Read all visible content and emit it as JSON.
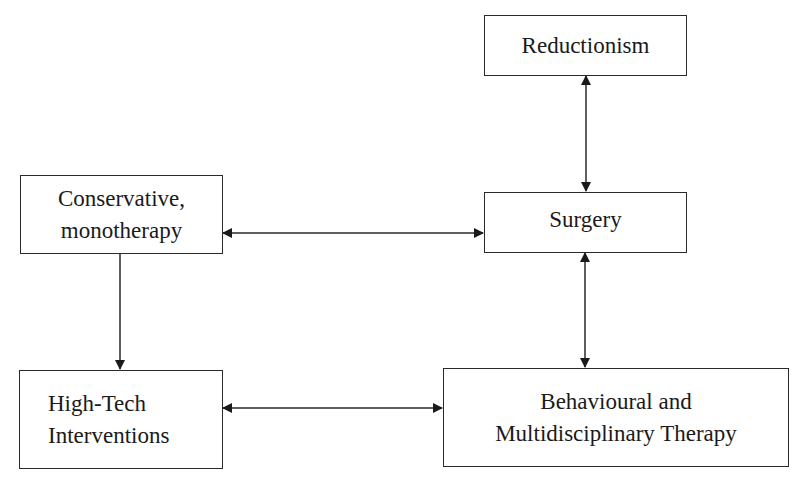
{
  "diagram": {
    "nodes": {
      "reductionism": {
        "lines": [
          "Reductionism"
        ]
      },
      "surgery": {
        "lines": [
          "Surgery"
        ]
      },
      "conservative": {
        "lines": [
          "Conservative,",
          "monotherapy"
        ]
      },
      "hightech": {
        "lines": [
          "High-Tech",
          "Interventions"
        ]
      },
      "behavioural": {
        "lines": [
          "Behavioural and",
          "Multidisciplinary Therapy"
        ]
      }
    },
    "edges": [
      {
        "from": "reductionism",
        "to": "surgery",
        "direction": "both"
      },
      {
        "from": "conservative",
        "to": "surgery",
        "direction": "both"
      },
      {
        "from": "conservative",
        "to": "hightech",
        "direction": "forward"
      },
      {
        "from": "surgery",
        "to": "behavioural",
        "direction": "both"
      },
      {
        "from": "hightech",
        "to": "behavioural",
        "direction": "both"
      }
    ],
    "colors": {
      "stroke": "#2a2a2a",
      "text": "#1a1a1a",
      "background": "#ffffff"
    }
  }
}
